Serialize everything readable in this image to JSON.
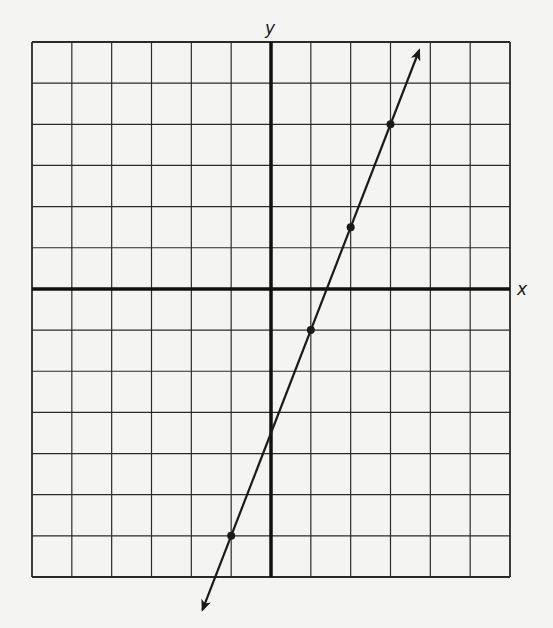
{
  "chart_data": {
    "type": "line",
    "title": "",
    "xlabel": "x",
    "ylabel": "y",
    "xlim": [
      -6,
      6
    ],
    "ylim": [
      -7,
      6
    ],
    "grid": true,
    "tick_labels": false,
    "legend": null,
    "series": [
      {
        "name": "line",
        "equation": "y = 2.5x - 3.5",
        "slope": 2.5,
        "intercept": -3.5,
        "arrows_both_ends": true,
        "marked_points": [
          {
            "x": 3,
            "y": 4
          },
          {
            "x": 2,
            "y": 1.5
          },
          {
            "x": 1,
            "y": -1
          },
          {
            "x": -1,
            "y": -6
          }
        ],
        "endpoints": [
          {
            "x": -1.72,
            "y": -7.8
          },
          {
            "x": 3.72,
            "y": 5.8
          }
        ]
      }
    ]
  },
  "colors": {
    "background": "#f4f4f2",
    "grid": "#2a2a2a",
    "axis": "#111111",
    "line": "#1a1a1a"
  },
  "labels": {
    "x": "x",
    "y": "y"
  }
}
